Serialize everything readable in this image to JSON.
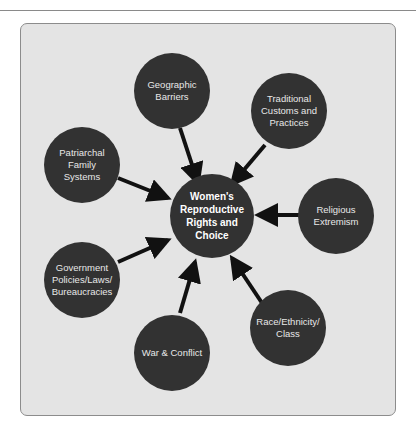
{
  "diagram": {
    "type": "hub-and-spoke",
    "center": {
      "label": "Women's Reproductive Rights and Choice"
    },
    "factors": [
      {
        "id": "geographic",
        "label": "Geographic Barriers"
      },
      {
        "id": "traditional",
        "label": "Traditional Customs and Practices"
      },
      {
        "id": "patriarchal",
        "label": "Patriarchal Family Systems"
      },
      {
        "id": "religious",
        "label": "Religious Extremism"
      },
      {
        "id": "government",
        "label": "Government Policies/Laws/ Bureaucracies"
      },
      {
        "id": "race",
        "label": "Race/Ethnicity/ Class"
      },
      {
        "id": "war",
        "label": "War & Conflict"
      }
    ],
    "arrow_direction": "factor-to-center",
    "colors": {
      "background": "#e4e4e4",
      "node_fill": "#323232",
      "node_text": "#e8e8e8",
      "arrow": "#111111",
      "frame_border": "#8c8c8c"
    }
  }
}
